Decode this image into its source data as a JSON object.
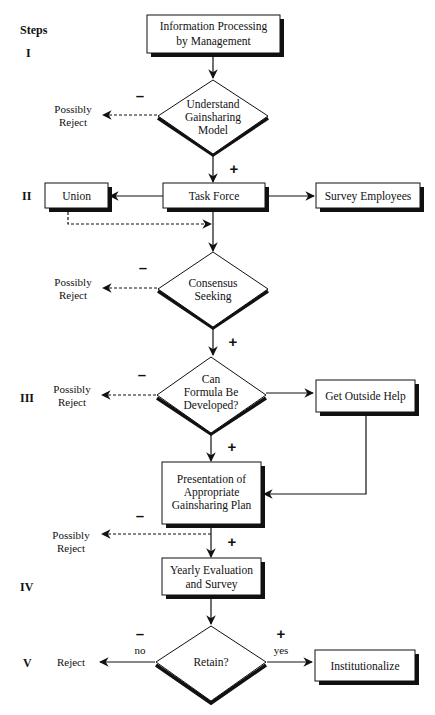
{
  "diagram": {
    "steps_header": "Steps",
    "step_labels": [
      "I",
      "II",
      "III",
      "IV",
      "V"
    ],
    "nodes": {
      "info_processing": {
        "type": "process",
        "lines": [
          "Information Processing",
          "by Management"
        ]
      },
      "understand_model": {
        "type": "decision",
        "lines": [
          "Understand",
          "Gainsharing",
          "Model"
        ]
      },
      "task_force": {
        "type": "process",
        "lines": [
          "Task Force"
        ]
      },
      "union": {
        "type": "process",
        "lines": [
          "Union"
        ]
      },
      "survey_employees": {
        "type": "process",
        "lines": [
          "Survey Employees"
        ]
      },
      "consensus": {
        "type": "decision",
        "lines": [
          "Consensus",
          "Seeking"
        ]
      },
      "formula": {
        "type": "decision",
        "lines": [
          "Can",
          "Formula Be",
          "Developed?"
        ]
      },
      "outside_help": {
        "type": "process",
        "lines": [
          "Get Outside Help"
        ]
      },
      "presentation": {
        "type": "process",
        "lines": [
          "Presentation of",
          "Appropriate",
          "Gainsharing Plan"
        ]
      },
      "yearly_eval": {
        "type": "process",
        "lines": [
          "Yearly Evaluation",
          "and Survey"
        ]
      },
      "retain": {
        "type": "decision",
        "lines": [
          "Retain?"
        ]
      },
      "institutionalize": {
        "type": "process",
        "lines": [
          "Institutionalize"
        ]
      }
    },
    "outcomes": {
      "possibly_reject": [
        "Possibly",
        "Reject"
      ],
      "reject": "Reject"
    },
    "signs": {
      "minus": "–",
      "plus": "+"
    },
    "edge_labels": {
      "no": "no",
      "yes": "yes"
    },
    "colors": {
      "line": "#111111",
      "shadow": "#111111",
      "background": "#ffffff"
    }
  }
}
